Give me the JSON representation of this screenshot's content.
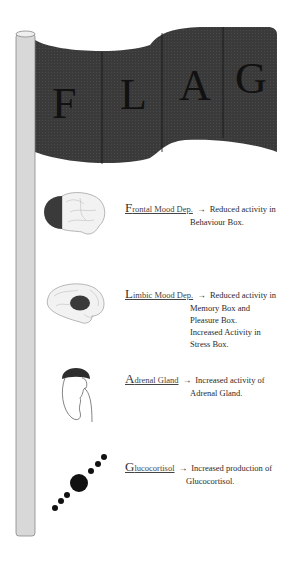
{
  "flag": {
    "letters": [
      "F",
      "L",
      "A",
      "G"
    ],
    "color": "#3a3a3a"
  },
  "pole": {
    "color": "#d8d8d8"
  },
  "items": [
    {
      "icon": "brain-frontal-highlight-icon",
      "term_initial": "F",
      "term_rest": "rontal Mood Dep.",
      "arrow": "→",
      "line1": "Reduced activity in",
      "lines": [
        "Behaviour Box."
      ]
    },
    {
      "icon": "brain-limbic-highlight-icon",
      "term_initial": "L",
      "term_rest": "imbic Mood Dep.",
      "arrow": "→",
      "line1": "Reduced activity in",
      "lines": [
        "Memory Box and",
        "Pleasure Box.",
        "Increased Activity in",
        "Stress Box."
      ]
    },
    {
      "icon": "kidney-adrenal-icon",
      "term_initial": "A",
      "term_rest": "drenal Gland",
      "arrow": "→",
      "line1": "Increased activity of",
      "lines": [
        "Adrenal Gland."
      ]
    },
    {
      "icon": "glucocortisol-molecule-icon",
      "term_initial": "G",
      "term_rest": "lucocortisol",
      "arrow": "→",
      "line1": "Increased production of",
      "lines": [
        "Glucocortisol."
      ]
    }
  ]
}
